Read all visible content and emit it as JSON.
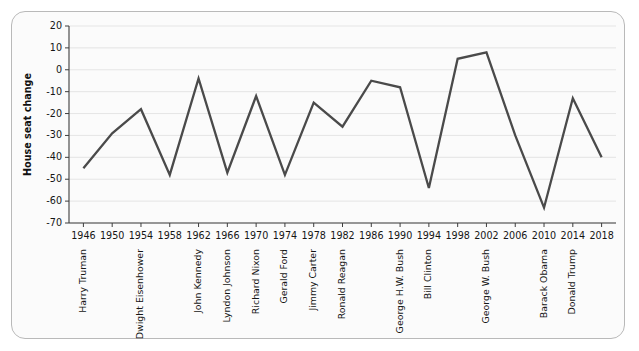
{
  "chart_data": {
    "type": "line",
    "title": "",
    "xlabel": "",
    "ylabel": "House seat change",
    "xlim": [
      1944,
      2020
    ],
    "ylim": [
      -70,
      20
    ],
    "grid": true,
    "legend": "none",
    "line_color": "#4a4a4a",
    "x": [
      1946,
      1950,
      1954,
      1958,
      1962,
      1966,
      1970,
      1974,
      1978,
      1982,
      1986,
      1990,
      1994,
      1998,
      2002,
      2006,
      2010,
      2014,
      2018
    ],
    "values": [
      -45,
      -29,
      -18,
      -48,
      -4,
      -47,
      -12,
      -48,
      -15,
      -26,
      -5,
      -8,
      -54,
      5,
      8,
      -30,
      -63,
      -13,
      -40
    ],
    "xticks": [
      "1946",
      "1950",
      "1954",
      "1958",
      "1962",
      "1966",
      "1970",
      "1974",
      "1978",
      "1982",
      "1986",
      "1990",
      "1994",
      "1998",
      "2002",
      "2006",
      "2010",
      "2014",
      "2018"
    ],
    "yticks": [
      "20",
      "10",
      "0",
      "-10",
      "-20",
      "-30",
      "-40",
      "-50",
      "-60",
      "-70"
    ],
    "ytick_values": [
      20,
      10,
      0,
      -10,
      -20,
      -30,
      -40,
      -50,
      -60,
      -70
    ],
    "annotations": [
      {
        "label": "Harry Truman",
        "year": 1946
      },
      {
        "label": "Dwight Eisenhower",
        "year": 1954
      },
      {
        "label": "John Kennedy",
        "year": 1962
      },
      {
        "label": "Lyndon Johnson",
        "year": 1966
      },
      {
        "label": "Richard Nixon",
        "year": 1970
      },
      {
        "label": "Gerald Ford",
        "year": 1974
      },
      {
        "label": "Jimmy Carter",
        "year": 1978
      },
      {
        "label": "Ronald Reagan",
        "year": 1982
      },
      {
        "label": "George H.W. Bush",
        "year": 1990
      },
      {
        "label": "Bill Clinton",
        "year": 1994
      },
      {
        "label": "George W. Bush",
        "year": 2002
      },
      {
        "label": "Barack Obama",
        "year": 2010
      },
      {
        "label": "Donald Trump",
        "year": 2014
      }
    ]
  }
}
